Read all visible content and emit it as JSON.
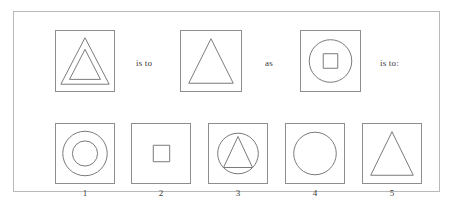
{
  "puzzle": {
    "type": "visual-analogy",
    "frame_color": "#b9b9b9",
    "box_border_color": "#8d8d8d",
    "glyph_stroke_color": "#7a7a7a",
    "background_color": "#ffffff",
    "premises": [
      {
        "id": "A",
        "position": "top-left",
        "shapes": [
          "triangle-outer",
          "triangle-inner"
        ],
        "description": "two nested concentric triangles inside a square frame"
      },
      {
        "id": "B",
        "position": "top-middle",
        "shapes": [
          "triangle"
        ],
        "description": "a single triangle inside a square frame"
      },
      {
        "id": "C",
        "position": "top-right",
        "shapes": [
          "circle",
          "square-inner"
        ],
        "description": "a circle with a small square centered inside, in a square frame"
      }
    ],
    "connectors": {
      "first": "is to",
      "middle": "as",
      "last": "is to:"
    },
    "options": [
      {
        "number": "1",
        "shapes": [
          "circle-outer",
          "circle-inner"
        ],
        "description": "two concentric circles"
      },
      {
        "number": "2",
        "shapes": [
          "square-inner"
        ],
        "description": "a small square centered in the frame"
      },
      {
        "number": "3",
        "shapes": [
          "circle",
          "triangle"
        ],
        "description": "a triangle inscribed in a circle"
      },
      {
        "number": "4",
        "shapes": [
          "circle"
        ],
        "description": "a single circle"
      },
      {
        "number": "5",
        "shapes": [
          "triangle"
        ],
        "description": "a single triangle"
      }
    ]
  }
}
